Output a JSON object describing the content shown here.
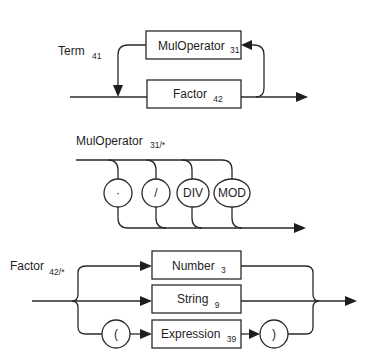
{
  "diagram": {
    "type": "syntax-diagram",
    "rules": [
      {
        "name": "Term",
        "ref": "41",
        "boxes": [
          {
            "label": "MulOperator",
            "ref": "31"
          },
          {
            "label": "Factor",
            "ref": "42"
          }
        ]
      },
      {
        "name": "MulOperator",
        "ref": "31/*",
        "terminals": [
          "·",
          "/",
          "DIV",
          "MOD"
        ]
      },
      {
        "name": "Factor",
        "ref": "42/*",
        "boxes": [
          {
            "label": "Number",
            "ref": "3"
          },
          {
            "label": "String",
            "ref": "9"
          },
          {
            "label": "Expression",
            "ref": "39"
          }
        ],
        "terminals": [
          "(",
          ")"
        ]
      }
    ]
  },
  "colors": {
    "line": "#2a2a2a",
    "text": "#1e1e1e",
    "background": "#ffffff"
  }
}
